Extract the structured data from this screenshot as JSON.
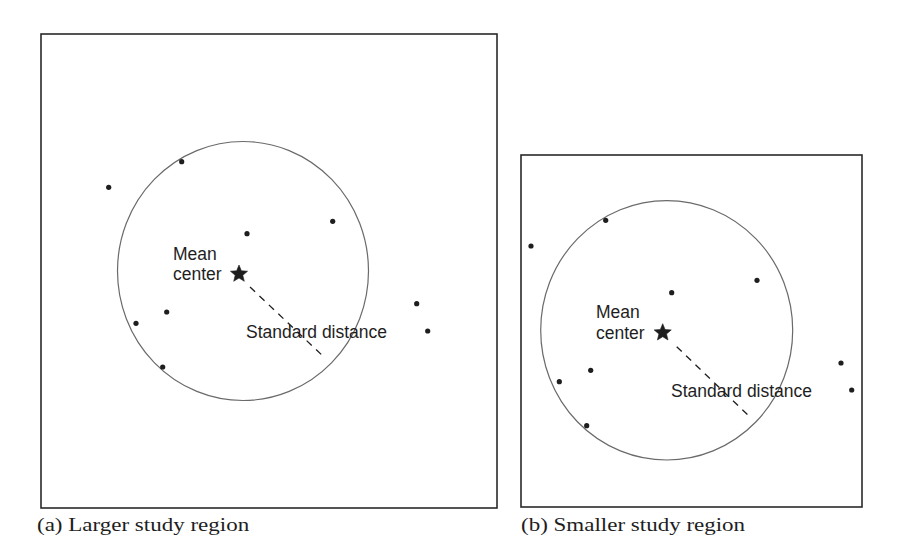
{
  "figure": {
    "panels": [
      {
        "id": "a",
        "caption": "(a) Larger study region",
        "frame": {
          "x": 41,
          "y": 34,
          "w": 456,
          "h": 474
        },
        "circle": {
          "cx": 243,
          "cy": 271,
          "rx": 125.5,
          "ry": 129.5
        },
        "mean_center": {
          "x": 239,
          "y": 274,
          "label_line1": "Mean",
          "label_line2": "center"
        },
        "standard_distance": {
          "label": "Standard distance",
          "line": {
            "x1": 250,
            "y1": 287,
            "x2": 325,
            "y2": 358
          }
        },
        "points": [
          [
            108.7,
            187.3
          ],
          [
            181.7,
            161.7
          ],
          [
            247,
            233.7
          ],
          [
            332.7,
            221.3
          ],
          [
            166.7,
            312
          ],
          [
            136,
            323.3
          ],
          [
            162.7,
            367
          ],
          [
            416.7,
            303.7
          ],
          [
            427.7,
            331
          ]
        ]
      },
      {
        "id": "b",
        "caption": "(b) Smaller study region",
        "frame": {
          "x": 521,
          "y": 155,
          "w": 341,
          "h": 352
        },
        "circle": {
          "cx": 666.7,
          "cy": 330.3,
          "rx": 126,
          "ry": 129.7
        },
        "mean_center": {
          "x": 662.7,
          "y": 332.7,
          "label_line1": "Mean",
          "label_line2": "center"
        },
        "standard_distance": {
          "label": "Standard distance",
          "line": {
            "x1": 676.7,
            "y1": 346.7,
            "x2": 750,
            "y2": 417
          }
        },
        "points": [
          [
            531,
            246
          ],
          [
            605.7,
            220.3
          ],
          [
            671.7,
            292.7
          ],
          [
            757,
            280.3
          ],
          [
            590.7,
            370.3
          ],
          [
            559.3,
            381.7
          ],
          [
            586.7,
            425.7
          ],
          [
            841,
            363
          ],
          [
            851.7,
            390
          ]
        ]
      }
    ],
    "colors": {
      "ink": "#1e1e1e",
      "circle": "#6a6a6a",
      "frame": "#2a2a2a",
      "background": "#ffffff"
    },
    "icons": {
      "mean_center_marker": "star-icon",
      "point_marker": "dot-icon"
    }
  }
}
